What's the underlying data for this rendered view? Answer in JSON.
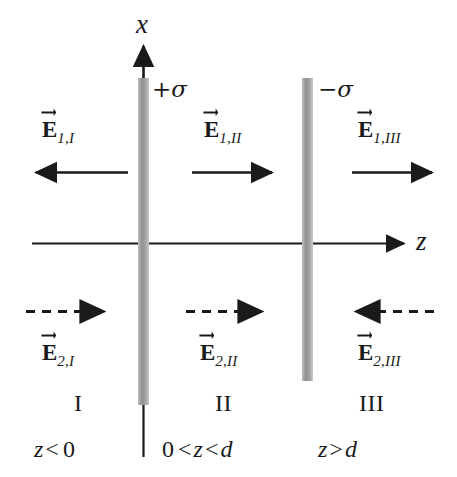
{
  "figure": {
    "type": "physics-diagram",
    "axes": {
      "vertical": {
        "name": "x",
        "label": "x",
        "direction": "up"
      },
      "horizontal": {
        "name": "z",
        "label": "z",
        "direction": "right"
      }
    },
    "colors": {
      "plate": "#9a9a9a",
      "line": "#1a1a1a",
      "background": "#ffffff"
    },
    "sheets": [
      {
        "id": "sheet-positive",
        "label_sign": "+",
        "label_symbol": "σ",
        "position": "z = 0"
      },
      {
        "id": "sheet-negative",
        "label_sign": "−",
        "label_symbol": "σ",
        "position": "z = d"
      }
    ],
    "regions": [
      {
        "id": "region-I",
        "roman": "I",
        "range": {
          "left": "z",
          "op": "<",
          "right": "0"
        },
        "field1": {
          "label_base": "E",
          "label_sub": "1,I",
          "sub_num": "1,",
          "sub_roman": "I",
          "direction": "left",
          "style": "solid"
        },
        "field2": {
          "label_base": "E",
          "label_sub": "2,I",
          "sub_num": "2,",
          "sub_roman": "I",
          "direction": "right",
          "style": "dashed"
        }
      },
      {
        "id": "region-II",
        "roman": "II",
        "range": {
          "left": "0",
          "op": "<",
          "mid": "z",
          "op2": "<",
          "right": "d"
        },
        "field1": {
          "label_base": "E",
          "label_sub": "1,II",
          "sub_num": "1,",
          "sub_roman": "II",
          "direction": "right",
          "style": "solid"
        },
        "field2": {
          "label_base": "E",
          "label_sub": "2,II",
          "sub_num": "2,",
          "sub_roman": "II",
          "direction": "right",
          "style": "dashed"
        }
      },
      {
        "id": "region-III",
        "roman": "III",
        "range": {
          "left": "z",
          "op": ">",
          "right": "d"
        },
        "field1": {
          "label_base": "E",
          "label_sub": "1,III",
          "sub_num": "1,",
          "sub_roman": "III",
          "direction": "right",
          "style": "solid"
        },
        "field2": {
          "label_base": "E",
          "label_sub": "2,III",
          "sub_num": "2,",
          "sub_roman": "III",
          "direction": "left",
          "style": "dashed"
        }
      }
    ]
  },
  "labels": {
    "axis_x": "x",
    "axis_z": "z",
    "sigma_positive_sign": "+",
    "sigma_positive_symbol": "σ",
    "sigma_negative_sign": "−",
    "sigma_negative_symbol": "σ",
    "E_base": "E",
    "sub_1_I": "1,I",
    "sub_1_II": "1,II",
    "sub_1_III": "1,III",
    "sub_2_I": "2,I",
    "sub_2_II": "2,II",
    "sub_2_III": "2,III",
    "roman_I": "I",
    "roman_II": "II",
    "roman_III": "III",
    "range_I": "z < 0",
    "range_II": "0 < z < d",
    "range_III": "z > d",
    "range_I_var": "z",
    "range_I_op": "<",
    "range_I_val": "0",
    "range_II_val0": "0",
    "range_II_op1": "<",
    "range_II_var": "z",
    "range_II_op2": "<",
    "range_II_val1": "d",
    "range_III_var": "z",
    "range_III_op": ">",
    "range_III_val": "d"
  }
}
